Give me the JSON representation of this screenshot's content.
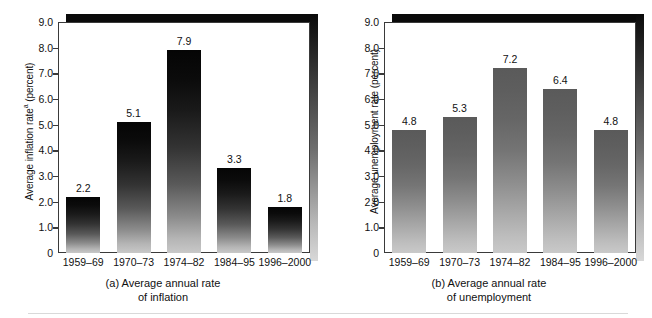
{
  "figure": {
    "background_color": "#ffffff",
    "bottom_rule_color": "#d9d9d9"
  },
  "chart_data": [
    {
      "type": "bar",
      "panel_id": "a",
      "title": "",
      "caption_line1": "(a) Average annual rate",
      "caption_line2": "of inflation",
      "xlabel": "",
      "ylabel": "Average inflation rate",
      "ylabel_superscript": "a",
      "ylabel_units": "(percent)",
      "categories": [
        "1959–69",
        "1970–73",
        "1974–82",
        "1984–95",
        "1996–2000"
      ],
      "values": [
        2.2,
        5.1,
        7.9,
        3.3,
        1.8
      ],
      "value_labels": [
        "2.2",
        "5.1",
        "7.9",
        "3.3",
        "1.8"
      ],
      "ylim": [
        0,
        9.0
      ],
      "yticks": [
        0,
        1.0,
        2.0,
        3.0,
        4.0,
        5.0,
        6.0,
        7.0,
        8.0,
        9.0
      ],
      "ytick_labels": [
        "0",
        "1.0",
        "2.0",
        "3.0",
        "4.0",
        "5.0",
        "6.0",
        "7.0",
        "8.0",
        "9.0"
      ],
      "grid": false,
      "legend": false,
      "bar_gradient_top": "#050505",
      "bar_gradient_bottom": "#c8c8c8"
    },
    {
      "type": "bar",
      "panel_id": "b",
      "title": "",
      "caption_line1": "(b) Average annual rate",
      "caption_line2": "of unemployment",
      "xlabel": "",
      "ylabel": "Average unemployment rate",
      "ylabel_superscript": "",
      "ylabel_units": "(percent)",
      "categories": [
        "1959–69",
        "1970–73",
        "1974–82",
        "1984–95",
        "1996–2000"
      ],
      "values": [
        4.8,
        5.3,
        7.2,
        6.4,
        4.8
      ],
      "value_labels": [
        "4.8",
        "5.3",
        "7.2",
        "6.4",
        "4.8"
      ],
      "ylim": [
        0,
        9.0
      ],
      "yticks": [
        0,
        1.0,
        2.0,
        3.0,
        4.0,
        5.0,
        6.0,
        7.0,
        8.0,
        9.0
      ],
      "ytick_labels": [
        "0",
        "1.0",
        "2.0",
        "3.0",
        "4.0",
        "5.0",
        "6.0",
        "7.0",
        "8.0",
        "9.0"
      ],
      "grid": false,
      "legend": false,
      "bar_gradient_top": "#5a5a5a",
      "bar_gradient_bottom": "#c9c9c9"
    }
  ]
}
